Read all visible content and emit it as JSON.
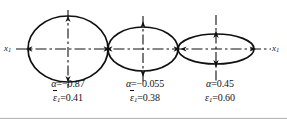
{
  "figure": {
    "background": "#ffffff",
    "stroke_color": "#111111",
    "axis": {
      "left_label_var": "x",
      "left_label_sub": "1",
      "right_label_var": "x",
      "right_label_sub": "1"
    },
    "ellipses": [
      {
        "name": "ellipse-left",
        "alpha_symbol": "α",
        "alpha_relation": "=−0.87",
        "alpha_text": "α =−0.87",
        "alpha_value": -0.87,
        "strain_symbol": "ε",
        "strain_sub": "1",
        "strain_overbar": true,
        "strain_relation": "=0.41",
        "strain_value": 0.41,
        "cx": 68,
        "cy": 49,
        "rx": 40,
        "ry": 33
      },
      {
        "name": "ellipse-middle",
        "alpha_symbol": "α",
        "alpha_relation": "=−0.055",
        "alpha_text": "α =−0.055",
        "alpha_value": -0.055,
        "strain_symbol": "ε",
        "strain_sub": "1",
        "strain_overbar": true,
        "strain_relation": "=0.38",
        "strain_value": 0.38,
        "cx": 143,
        "cy": 49,
        "rx": 35,
        "ry": 22
      },
      {
        "name": "ellipse-right",
        "alpha_symbol": "α",
        "alpha_relation": "=0.45",
        "alpha_text": "α =0.45",
        "alpha_value": 0.45,
        "strain_symbol": "ε",
        "strain_sub": "1",
        "strain_overbar": false,
        "strain_relation": "=0.60",
        "strain_value": 0.6,
        "cx": 216,
        "cy": 49,
        "rx": 38,
        "ry": 15
      }
    ]
  }
}
